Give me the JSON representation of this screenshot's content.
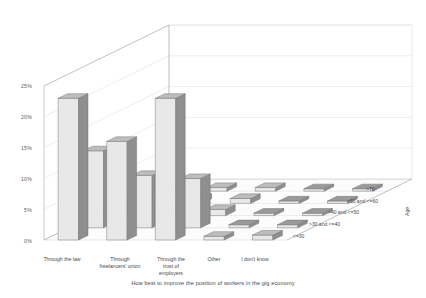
{
  "chart_data": {
    "type": "bar",
    "title": "How best to improve the position of workers in the gig economy",
    "xlabel": "",
    "ylabel": "",
    "zlabel": "Age",
    "ylim": [
      0,
      25
    ],
    "ytick_labels": [
      "0%",
      "5%",
      "10%",
      "15%",
      "20%",
      "25%"
    ],
    "ytick_values": [
      0,
      5,
      10,
      15,
      20,
      25
    ],
    "grid": true,
    "legend_position": "depth-axis-right",
    "categories": [
      "Through the law",
      "Through freelancers' union",
      "Through the trust of employers",
      "Other",
      "I don't know"
    ],
    "series": [
      {
        "name": "<=30",
        "values": [
          23.0,
          16.0,
          23.0,
          0.6,
          0.8
        ]
      },
      {
        "name": ">30 and <=40",
        "values": [
          12.5,
          8.5,
          8.0,
          0.5,
          0.5
        ]
      },
      {
        "name": ">40 and <=50",
        "values": [
          1.2,
          1.0,
          1.0,
          0.4,
          0.4
        ]
      },
      {
        "name": ">50 and <=60",
        "values": [
          0.8,
          0.8,
          0.8,
          0.4,
          0.4
        ]
      },
      {
        "name": ">70",
        "values": [
          0.6,
          0.6,
          0.6,
          0.4,
          0.4
        ]
      }
    ]
  },
  "axis": {
    "y_ticks": [
      "25%",
      "20%",
      "15%",
      "10%",
      "5%",
      "0%"
    ],
    "age_title": "Age",
    "age_groups": [
      ">70",
      ">50 and <=60",
      ">40 and <=50",
      ">30 and <=40",
      "<=30"
    ]
  },
  "categories": [
    {
      "lines": [
        "Through the law"
      ]
    },
    {
      "lines": [
        "Through",
        "freelancers' union"
      ]
    },
    {
      "lines": [
        "Through the",
        "trust of",
        "employers"
      ]
    },
    {
      "lines": [
        "Other"
      ]
    },
    {
      "lines": [
        "I don't know"
      ]
    }
  ],
  "title": {
    "text": "How best to improve the position of workers in the gig economy"
  },
  "colors": {
    "bar_front": "#e8e8e8",
    "bar_side": "#8f8f8f",
    "bar_top": "#bdbdbd",
    "flat_top": "#9a9a9a",
    "floor": "#fcfcfc",
    "grid": "#d5d5d5",
    "axis": "#9a9a9a",
    "text": "#4a4a4a"
  }
}
